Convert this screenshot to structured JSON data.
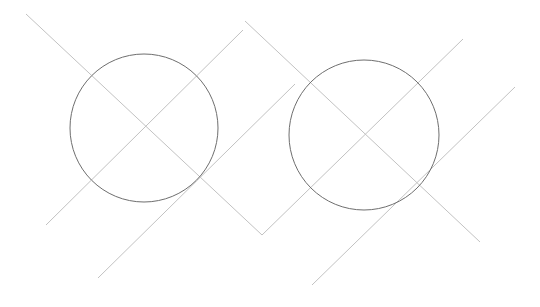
{
  "canvas": {
    "width": 540,
    "height": 307,
    "background_color": "#ffffff"
  },
  "styles": {
    "construction_line_color": "#c2c2c2",
    "construction_line_width": 1,
    "circle_stroke_color": "#6e6e6e",
    "circle_stroke_width": 1
  },
  "shapes": {
    "circles": [
      {
        "name": "circle-left",
        "cx": 144,
        "cy": 128,
        "r": 74
      },
      {
        "name": "circle-right",
        "cx": 364,
        "cy": 135,
        "r": 75
      }
    ],
    "lines": [
      {
        "name": "diagonal-line-topleft-to-bottommiddle",
        "x1": 26,
        "y1": 14,
        "x2": 262,
        "y2": 235
      },
      {
        "name": "diagonal-line-bottomleft-to-topmiddle",
        "x1": 46,
        "y1": 225,
        "x2": 243,
        "y2": 30
      },
      {
        "name": "diagonal-line-topmiddle-to-bottomright",
        "x1": 245,
        "y1": 21,
        "x2": 480,
        "y2": 242
      },
      {
        "name": "diagonal-line-bottommiddle-to-topright",
        "x1": 262,
        "y1": 235,
        "x2": 463,
        "y2": 39
      },
      {
        "name": "diagonal-line-short-left",
        "x1": 98,
        "y1": 278,
        "x2": 295,
        "y2": 84
      },
      {
        "name": "diagonal-line-short-right",
        "x1": 312,
        "y1": 285,
        "x2": 515,
        "y2": 87
      }
    ]
  }
}
